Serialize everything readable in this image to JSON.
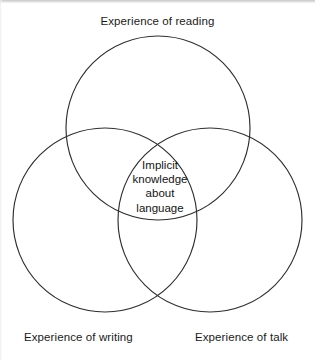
{
  "diagram": {
    "type": "venn",
    "set_count": 3,
    "stroke_color": "#2e2e2e",
    "background_color": "#ffffff",
    "top_label": "Experience of reading",
    "bottom_left_label": "Experience of writing",
    "bottom_right_label": "Experience of talk",
    "center": {
      "line1": "Implicit",
      "line2": "knowledge",
      "line3": "about",
      "line4": "language"
    },
    "circles": [
      {
        "name": "reading",
        "cx": 158,
        "cy": 128,
        "r": 92
      },
      {
        "name": "writing",
        "cx": 105,
        "cy": 220,
        "r": 92
      },
      {
        "name": "talk",
        "cx": 210,
        "cy": 220,
        "r": 92
      }
    ]
  }
}
